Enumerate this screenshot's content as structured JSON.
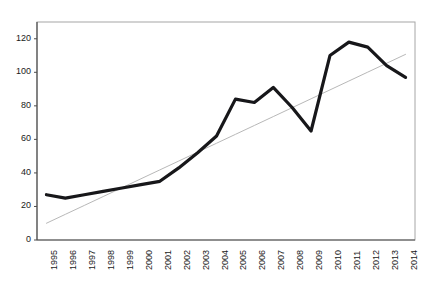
{
  "chart_data": {
    "type": "line",
    "title": "",
    "subtitle": "",
    "xlabel": "",
    "ylabel": "",
    "categories": [
      "1995",
      "1996",
      "1997",
      "1998",
      "1999",
      "2000",
      "2001",
      "2002",
      "2003",
      "2004",
      "2005",
      "2006",
      "2007",
      "2008",
      "2009",
      "2010",
      "2011",
      "2012",
      "2013",
      "2014"
    ],
    "series": [
      {
        "name": "data",
        "type": "line",
        "color": "#17171a",
        "width": 3.2,
        "values": [
          27,
          25,
          27,
          29,
          31,
          33,
          35,
          43,
          52,
          62,
          84,
          82,
          91,
          79,
          65,
          110,
          118,
          115,
          104,
          97
        ]
      },
      {
        "name": "trendline",
        "type": "linear-trend",
        "color": "#b8b8b8",
        "width": 1,
        "values": [
          10,
          15.3,
          20.6,
          25.9,
          31.2,
          36.5,
          41.8,
          47.1,
          52.4,
          57.7,
          63,
          68.3,
          73.6,
          78.9,
          84.2,
          89.5,
          94.8,
          100.1,
          105.4,
          110.7
        ]
      }
    ],
    "yticks": [
      0,
      20,
      40,
      60,
      80,
      100,
      120
    ],
    "ylim": [
      0,
      130
    ],
    "xticklabel_rotation": -90,
    "grid": false,
    "legend": "none",
    "plot_border_color": "#a6a6a6",
    "axis_color": "#4d4d4d",
    "background": "#ffffff"
  },
  "plot_geometry": {
    "left": 37,
    "right": 415,
    "top": 22,
    "bottom": 240
  }
}
